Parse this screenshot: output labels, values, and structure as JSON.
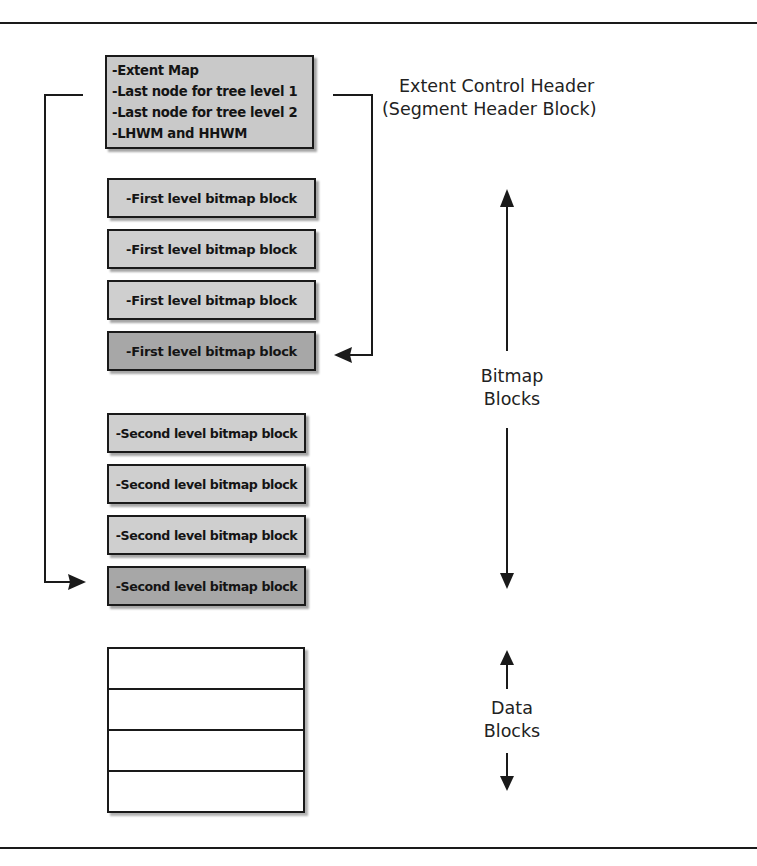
{
  "diagram": {
    "header_block": {
      "lines": [
        "-Extent Map",
        "-Last node for tree level 1",
        "-Last node for tree level 2",
        "-LHWM and HHWM"
      ],
      "label_line1": "Extent Control Header",
      "label_line2": "(Segment Header Block)"
    },
    "first_level_blocks": [
      {
        "label": "-First level bitmap block",
        "shade": "light"
      },
      {
        "label": "-First level bitmap block",
        "shade": "light"
      },
      {
        "label": "-First level bitmap block",
        "shade": "light"
      },
      {
        "label": "-First level bitmap block",
        "shade": "dark"
      }
    ],
    "second_level_blocks": [
      {
        "label": "-Second level bitmap block",
        "shade": "light"
      },
      {
        "label": "-Second level bitmap block",
        "shade": "light"
      },
      {
        "label": "-Second level bitmap block",
        "shade": "light"
      },
      {
        "label": "-Second level bitmap block",
        "shade": "dark"
      }
    ],
    "bitmap_label": {
      "line1": "Bitmap",
      "line2": "Blocks"
    },
    "data_label": {
      "line1": "Data",
      "line2": "Blocks"
    },
    "data_block_rows": 4,
    "connectors": [
      {
        "from": "Last node for tree level 1",
        "to": "First level bitmap block #4",
        "side": "right"
      },
      {
        "from": "Last node for tree level 2",
        "to": "Second level bitmap block #4",
        "side": "left"
      }
    ],
    "colors": {
      "light_fill": "#cfcfcf",
      "dark_fill": "#a7a7a7",
      "header_fill": "#c9c9c9",
      "stroke": "#1a1a1a"
    }
  }
}
